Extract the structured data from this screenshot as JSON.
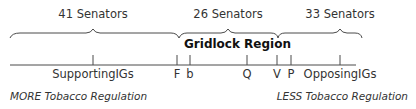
{
  "groups": [
    {
      "label": "41 Senators",
      "x": 93
    },
    {
      "label": "26 Senators",
      "x": 228
    },
    {
      "label": "33 Senators",
      "x": 340
    }
  ],
  "region_label": "Gridlock Region",
  "points": [
    {
      "label": "SupportingIGs",
      "x": 93
    },
    {
      "label": "F",
      "x": 177
    },
    {
      "label": "b",
      "x": 190
    },
    {
      "label": "Q",
      "x": 247
    },
    {
      "label": "V",
      "x": 277
    },
    {
      "label": "P",
      "x": 291
    },
    {
      "label": "OpposingIGs",
      "x": 340
    }
  ],
  "axis": {
    "left_label": "MORE Tobacco Regulation",
    "right_label": "LESS Tobacco Regulation"
  },
  "colors": {
    "line": "#4a4a4a",
    "text": "#333333"
  }
}
